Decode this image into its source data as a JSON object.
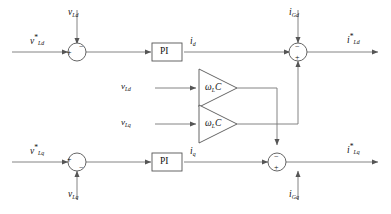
{
  "diagram": {
    "type": "control-block-diagram",
    "width": 391,
    "height": 214,
    "line_color": "#555555",
    "text_color": "#111111"
  },
  "labels": {
    "v_Ld_ref": {
      "base": "v",
      "sup": "*",
      "sub": "Ld"
    },
    "v_Ld": {
      "base": "v",
      "sub": "Ld"
    },
    "v_Lq_ref": {
      "base": "v",
      "sup": "*",
      "sub": "Lq"
    },
    "v_Lq": {
      "base": "v",
      "sub": "Lq"
    },
    "i_d": {
      "base": "i",
      "sub": "d"
    },
    "i_q": {
      "base": "i",
      "sub": "q"
    },
    "i_Gd": {
      "base": "i",
      "sub": "Gd"
    },
    "i_Gq": {
      "base": "i",
      "sub": "Gq"
    },
    "i_Ld_ref": {
      "base": "i",
      "sup": "*",
      "sub": "Ld"
    },
    "i_Lq_ref": {
      "base": "i",
      "sup": "*",
      "sub": "Lq"
    }
  },
  "blocks": {
    "pi_top": {
      "label": "PI",
      "kind": "controller"
    },
    "pi_bottom": {
      "label": "PI",
      "kind": "controller"
    },
    "gain_top": {
      "symbol": "ω",
      "sub": "L",
      "tail": "C",
      "kind": "gain-triangle"
    },
    "gain_bottom": {
      "symbol": "ω",
      "sub": "L",
      "tail": "C",
      "kind": "gain-triangle"
    }
  },
  "summing_junctions": {
    "top_left": {
      "left_sign": "+",
      "top_sign": "−"
    },
    "top_right": {
      "top_sign": "−",
      "bottom_sign": "+"
    },
    "bottom_left": {
      "left_sign": "+",
      "bottom_sign": "−"
    },
    "bottom_right": {
      "top_sign": "−",
      "bottom_sign": "+"
    }
  }
}
